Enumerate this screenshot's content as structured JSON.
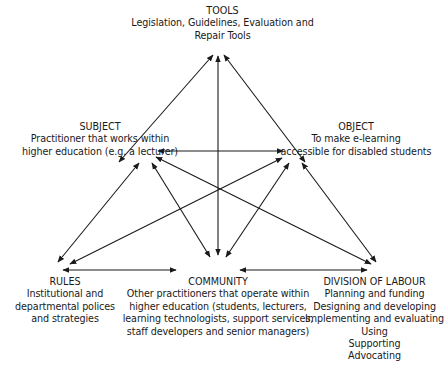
{
  "diagram": {
    "type": "activity-system-triangle",
    "line_color": "#1a1a1a",
    "nodes": {
      "tools": {
        "title": "TOOLS",
        "lines": [
          "Legislation, Guidelines, Evaluation and",
          "Repair Tools"
        ]
      },
      "subject": {
        "title": "SUBJECT",
        "lines": [
          "Practitioner that works within",
          "higher education (e.g. a lecturer)"
        ]
      },
      "object": {
        "title": "OBJECT",
        "lines": [
          "To make e-learning",
          "accessible for disabled students"
        ]
      },
      "rules": {
        "title": "RULES",
        "lines": [
          "Institutional and",
          "departmental polices",
          "and strategies"
        ]
      },
      "community": {
        "title": "COMMUNITY",
        "lines": [
          "Other practitioners that operate within",
          "higher education (students, lecturers,",
          "learning technologists, support services,",
          "staff developers and senior managers)"
        ]
      },
      "division_of_labour": {
        "title": "DIVISION OF LABOUR",
        "lines": [
          "Planning and funding",
          "Designing and developing",
          "Implementing and evaluating",
          "Using",
          "Supporting",
          "Advocating"
        ]
      }
    },
    "connections": [
      {
        "from": "tools",
        "to": "subject",
        "bidirectional": true
      },
      {
        "from": "tools",
        "to": "object",
        "bidirectional": true
      },
      {
        "from": "tools",
        "to": "community",
        "bidirectional": true
      },
      {
        "from": "subject",
        "to": "object",
        "bidirectional": true
      },
      {
        "from": "subject",
        "to": "rules",
        "bidirectional": true
      },
      {
        "from": "subject",
        "to": "community",
        "bidirectional": true
      },
      {
        "from": "subject",
        "to": "division_of_labour",
        "bidirectional": true
      },
      {
        "from": "object",
        "to": "rules",
        "bidirectional": true
      },
      {
        "from": "object",
        "to": "community",
        "bidirectional": true
      },
      {
        "from": "object",
        "to": "division_of_labour",
        "bidirectional": true
      },
      {
        "from": "rules",
        "to": "community",
        "bidirectional": true
      },
      {
        "from": "community",
        "to": "division_of_labour",
        "bidirectional": true
      }
    ]
  }
}
